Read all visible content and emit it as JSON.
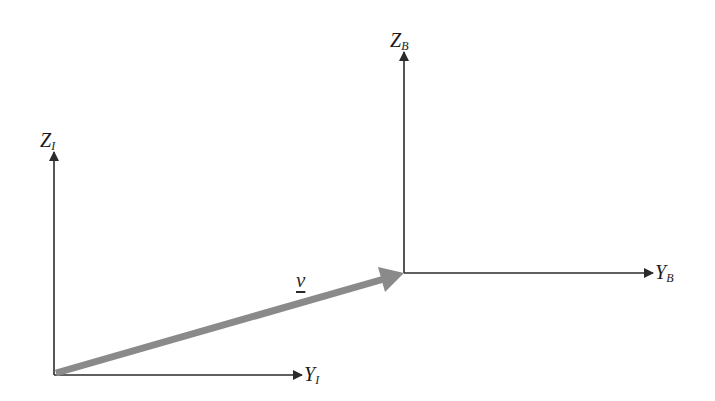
{
  "diagram": {
    "type": "coordinate-frames",
    "frames": [
      {
        "name": "inertial",
        "origin": [
          54,
          375
        ],
        "axes": {
          "z": {
            "label": "Z",
            "subscript": "I",
            "tip": [
              54,
              150
            ]
          },
          "y": {
            "label": "Y",
            "subscript": "I",
            "tip": [
              302,
              375
            ]
          }
        }
      },
      {
        "name": "body",
        "origin": [
          404,
          273
        ],
        "axes": {
          "z": {
            "label": "Z",
            "subscript": "B",
            "tip": [
              404,
              52
            ]
          },
          "y": {
            "label": "Y",
            "subscript": "B",
            "tip": [
              653,
              273
            ]
          }
        }
      }
    ],
    "vector": {
      "label": "v",
      "underlined": true,
      "from": [
        54,
        375
      ],
      "to": [
        404,
        273
      ],
      "color": "#8a8a8a"
    },
    "axis_color": "#2b2b2b"
  },
  "labels": {
    "zi_main": "Z",
    "zi_sub": "I",
    "yi_main": "Y",
    "yi_sub": "I",
    "zb_main": "Z",
    "zb_sub": "B",
    "yb_main": "Y",
    "yb_sub": "B",
    "v": "v"
  }
}
